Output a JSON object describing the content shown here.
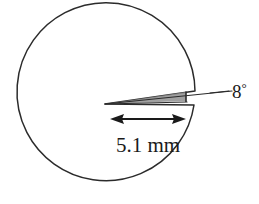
{
  "figure": {
    "type": "technical-diagram",
    "background_color": "#ffffff",
    "stroke_color": "#2b2b2b",
    "shade_color": "#8c8c8c",
    "text_color": "#1a1a1a"
  },
  "circle": {
    "center_x": 108,
    "center_y": 102,
    "radius": 89,
    "stroke_width": 1.4
  },
  "wedge": {
    "apex_x": 105,
    "apex_y": 104,
    "angle_deg": 8,
    "shaded": true,
    "shade_color": "#8f8f8f"
  },
  "labels": {
    "angle": {
      "value": "8",
      "unit_symbol": "°",
      "full": "8°"
    },
    "dimension": {
      "value": "5.1",
      "unit": "mm",
      "full": "5.1 mm"
    }
  },
  "dimension_arrow": {
    "start_x": 112,
    "end_x": 184,
    "y": 119,
    "double_headed": true
  },
  "leader_line": {
    "from_x": 188,
    "from_y": 98,
    "to_x": 228,
    "to_y": 92
  }
}
